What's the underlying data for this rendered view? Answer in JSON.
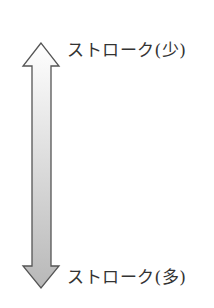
{
  "diagram": {
    "type": "double-headed-vertical-arrow",
    "top_label": "ストローク(少)",
    "bottom_label": "ストローク(多)",
    "colors": {
      "outline": "#555555",
      "gradient_top": "#ffffff",
      "gradient_bottom": "#b8b8b8"
    }
  }
}
